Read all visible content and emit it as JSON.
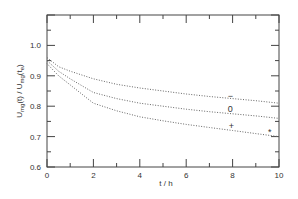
{
  "chart_data": {
    "type": "line",
    "title": "",
    "xlabel": "t / h",
    "ylabel": "U_mg(t) / U_mg(t_e)",
    "xlim": [
      0,
      10
    ],
    "ylim": [
      0.6,
      1.1
    ],
    "x_ticks": [
      0,
      2,
      4,
      6,
      8,
      10
    ],
    "x_tick_labels": [
      "0",
      "2",
      "4",
      "6",
      "8",
      "10"
    ],
    "y_ticks": [
      0.6,
      0.7,
      0.8,
      0.9,
      1.0
    ],
    "y_tick_labels": [
      "0.6",
      "0.7",
      "0.8",
      "0.9",
      "1.0"
    ],
    "grid": false,
    "line_style": "dotted",
    "x": [
      0,
      0.5,
      1,
      2,
      3,
      4,
      5,
      6,
      7,
      8,
      9,
      10
    ],
    "series": [
      {
        "name": "−",
        "marker": "−",
        "values": [
          0.96,
          0.93,
          0.915,
          0.89,
          0.872,
          0.86,
          0.85,
          0.84,
          0.832,
          0.825,
          0.818,
          0.81
        ]
      },
      {
        "name": "0",
        "marker": "0",
        "values": [
          0.95,
          0.915,
          0.89,
          0.845,
          0.825,
          0.81,
          0.8,
          0.79,
          0.782,
          0.775,
          0.768,
          0.76
        ]
      },
      {
        "name": "+",
        "marker": "+",
        "values": [
          0.94,
          0.9,
          0.87,
          0.81,
          0.785,
          0.765,
          0.752,
          0.74,
          0.73,
          0.72,
          0.71,
          0.7
        ]
      }
    ],
    "annotations": [
      {
        "text": "−",
        "x": 7.9,
        "y": 0.835
      },
      {
        "text": "0",
        "x": 7.9,
        "y": 0.79
      },
      {
        "text": "+",
        "x": 7.95,
        "y": 0.735
      },
      {
        "text": "*",
        "x": 9.6,
        "y": 0.715
      }
    ]
  },
  "axes": {
    "xlabel": "t / h",
    "ylabel_main": "U",
    "ylabel_sub1": "mg",
    "ylabel_mid": "(t) / U",
    "ylabel_sub2": "mg",
    "ylabel_end": "(t",
    "ylabel_sub3": "e",
    "ylabel_close": ")"
  }
}
